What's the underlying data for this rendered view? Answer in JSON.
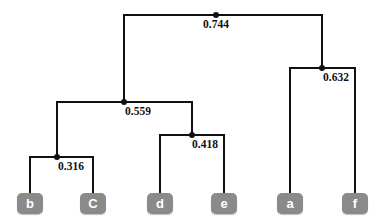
{
  "figure": {
    "type": "dendrogram",
    "width": 386,
    "height": 220,
    "background_color": "#ffffff",
    "line_color": "#111111",
    "leaf_box_color": "#8a8a8a",
    "leaf_text_color": "#ffffff"
  },
  "leaves": [
    {
      "id": "b",
      "label": "b",
      "x": 30,
      "y": 203
    },
    {
      "id": "C",
      "label": "C",
      "x": 93,
      "y": 203
    },
    {
      "id": "d",
      "label": "d",
      "x": 160,
      "y": 203
    },
    {
      "id": "e",
      "label": "e",
      "x": 224,
      "y": 203
    },
    {
      "id": "a",
      "label": "a",
      "x": 290,
      "y": 203
    },
    {
      "id": "f",
      "label": "f",
      "x": 355,
      "y": 203
    }
  ],
  "merges": [
    {
      "id": "m-bC",
      "label": "0.316",
      "height": 0.316,
      "x": 57,
      "y": 157,
      "left_x": 30,
      "right_x": 93,
      "left_child_y": 193,
      "right_child_y": 193,
      "label_x": 71,
      "label_y": 160
    },
    {
      "id": "m-de",
      "label": "0.418",
      "height": 0.418,
      "x": 192,
      "y": 135,
      "left_x": 160,
      "right_x": 224,
      "left_child_y": 193,
      "right_child_y": 193,
      "label_x": 205,
      "label_y": 138
    },
    {
      "id": "m-bCde",
      "label": "0.559",
      "height": 0.559,
      "x": 124,
      "y": 102,
      "left_x": 57,
      "right_x": 192,
      "left_child_y": 157,
      "right_child_y": 135,
      "label_x": 138,
      "label_y": 105
    },
    {
      "id": "m-af",
      "label": "0.632",
      "height": 0.632,
      "x": 322,
      "y": 68,
      "left_x": 290,
      "right_x": 355,
      "left_child_y": 193,
      "right_child_y": 193,
      "label_x": 336,
      "label_y": 71
    },
    {
      "id": "m-root",
      "label": "0.744",
      "height": 0.744,
      "x": 216,
      "y": 15,
      "left_x": 124,
      "right_x": 322,
      "left_child_y": 102,
      "right_child_y": 68,
      "label_x": 216,
      "label_y": 18
    }
  ],
  "chart_data": {
    "type": "dendrogram",
    "title": "",
    "xlabel": "",
    "ylabel": "",
    "leaf_order": [
      "b",
      "C",
      "d",
      "e",
      "a",
      "f"
    ],
    "merge_heights": [
      0.316,
      0.418,
      0.559,
      0.632,
      0.744
    ],
    "linkage": [
      {
        "merge": "0.316",
        "members": [
          "b",
          "C"
        ]
      },
      {
        "merge": "0.418",
        "members": [
          "d",
          "e"
        ]
      },
      {
        "merge": "0.559",
        "members": [
          "b",
          "C",
          "d",
          "e"
        ]
      },
      {
        "merge": "0.632",
        "members": [
          "a",
          "f"
        ]
      },
      {
        "merge": "0.744",
        "members": [
          "b",
          "C",
          "d",
          "e",
          "a",
          "f"
        ]
      }
    ],
    "legend": [],
    "grid": false
  }
}
